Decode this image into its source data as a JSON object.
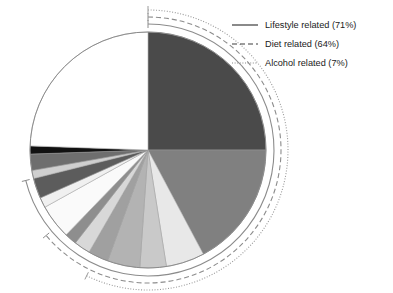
{
  "chart_data": {
    "type": "pie",
    "title": "",
    "subtitle": "",
    "xlabel": "",
    "ylabel": "",
    "grid": false,
    "legend_position": "top-right",
    "center": {
      "x": 148,
      "y": 150
    },
    "radius": 118,
    "start_angle_deg": 0,
    "direction": "clockwise",
    "outline_color": "#8c8c8c",
    "categories": [
      "Slice 1",
      "Slice 2",
      "Slice 3",
      "Slice 4",
      "Slice 5",
      "Slice 6",
      "Slice 7",
      "Slice 8",
      "Slice 9",
      "Slice 10",
      "Slice 11",
      "Slice 12",
      "Slice 13",
      "Slice 14",
      "Slice 15"
    ],
    "values": [
      25.0,
      17.2,
      5.3,
      3.6,
      4.4,
      2.8,
      2.2,
      1.7,
      4.7,
      1.4,
      2.8,
      1.1,
      2.2,
      1.1,
      24.5
    ],
    "angles_deg": [
      90.0,
      62.0,
      19.0,
      13.0,
      16.0,
      10.0,
      8.0,
      6.0,
      17.0,
      5.0,
      10.0,
      4.0,
      8.0,
      4.0,
      88.0
    ],
    "colors": [
      "#4a4a4a",
      "#808080",
      "#e8e8e8",
      "#c9c9c9",
      "#b3b3b3",
      "#a0a0a0",
      "#d8d8d8",
      "#8e8e8e",
      "#fafafa",
      "#f0f0f0",
      "#5c5c5c",
      "#cfcfcf",
      "#6e6e6e",
      "#111111",
      "#ffffff"
    ]
  },
  "legend": {
    "items": [
      {
        "label": "Lifestyle related (71%)",
        "style": "solid",
        "name": "lifestyle",
        "percent": 71,
        "color": "#3c3c3c"
      },
      {
        "label": "Diet related (64%)",
        "style": "dashed",
        "name": "diet",
        "percent": 64,
        "color": "#3c3c3c"
      },
      {
        "label": "Alcohol related (7%)",
        "style": "dotted",
        "name": "alcohol",
        "percent": 7,
        "color": "#7a7a7a"
      }
    ]
  },
  "annotations": {
    "arcs": [
      {
        "name": "lifestyle-arc",
        "style": "solid",
        "radius": 126,
        "start_deg": 0,
        "end_deg": 256,
        "color": "#8c8c8c"
      },
      {
        "name": "diet-arc",
        "style": "dashed",
        "radius": 133,
        "start_deg": 0,
        "end_deg": 230,
        "color": "#8c8c8c"
      },
      {
        "name": "alcohol-arc",
        "style": "dotted",
        "radius": 140,
        "start_deg": 0,
        "end_deg": 206,
        "color": "#9a9a9a"
      }
    ],
    "tick_marks": 5
  }
}
